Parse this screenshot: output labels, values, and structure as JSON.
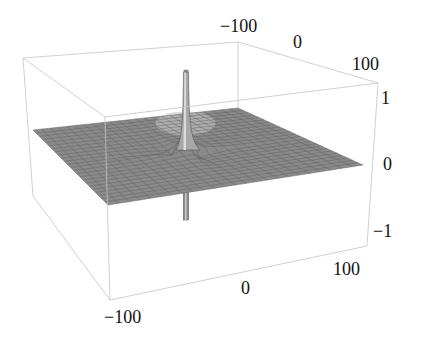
{
  "chart_data": {
    "type": "surface3d",
    "title": "",
    "x_axis": {
      "label": "",
      "range": [
        -100,
        100
      ],
      "ticks": [
        -100,
        0,
        100
      ]
    },
    "y_axis": {
      "label": "",
      "range": [
        -100,
        100
      ],
      "ticks": [
        -100,
        0,
        100
      ]
    },
    "z_axis": {
      "label": "",
      "range": [
        -1,
        1
      ],
      "ticks": [
        -1,
        0,
        1
      ]
    },
    "grid_divisions": 24,
    "surface_color": "#8a8a8a",
    "mesh_color": "#5e5e5e",
    "box_color": "#c4c4c4",
    "features": [
      {
        "name": "spike-up",
        "x": 0,
        "y": 0,
        "z": 1
      },
      {
        "name": "spike-down",
        "x": 0,
        "y": 0,
        "z": -1
      }
    ]
  },
  "labels": {
    "back_x_ticks": [
      "−100",
      "0",
      "100"
    ],
    "z_ticks": [
      "1",
      "0",
      "−1"
    ],
    "front_y_ticks": [
      "−100",
      "0",
      "100"
    ]
  }
}
